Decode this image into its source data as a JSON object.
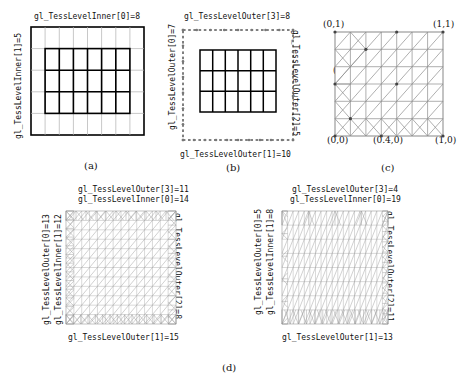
{
  "figure": {
    "caption_labels": [
      "(a)",
      "(b)",
      "(c)",
      "(d)"
    ]
  },
  "panel_a": {
    "name": "quad-inner-tessellation",
    "top_label": "gl_TessLevelInner[0]=8",
    "left_label": "gl_TessLevelInner[1]=5",
    "inner_u": 8,
    "inner_v": 5
  },
  "panel_b": {
    "name": "quad-outer-tessellation",
    "top_label": "gl_TessLevelOuter[3]=8",
    "left_label": "gl_TessLevelOuter[0]=7",
    "right_label": "gl_TessLevelOuter[2]=5",
    "bottom_label": "gl_TessLevelOuter[1]=10",
    "outer": [
      7,
      10,
      5,
      8
    ]
  },
  "panel_c": {
    "name": "quad-domain-coordinates",
    "corner_labels": [
      "(0,1)",
      "(1,1)",
      "(0,0)",
      "(1,0)"
    ],
    "interior_labels": [
      "(0.25,0.8)",
      "(0,0.57)",
      "(0.5,0.4)",
      "(0.4,0)"
    ],
    "points": [
      {
        "label": "(0,1)",
        "u": 0.0,
        "v": 1.0
      },
      {
        "label": "(1,1)",
        "u": 1.0,
        "v": 1.0
      },
      {
        "label": "(0,0)",
        "u": 0.0,
        "v": 0.0
      },
      {
        "label": "(1,0)",
        "u": 1.0,
        "v": 0.0
      },
      {
        "label": "(0.25,0.8)",
        "u": 0.25,
        "v": 0.8
      },
      {
        "label": "(0,0.57)",
        "u": 0.0,
        "v": 0.57
      },
      {
        "label": "(0.5,0.4)",
        "u": 0.5,
        "v": 0.4
      },
      {
        "label": "(0.4,0)",
        "u": 0.4,
        "v": 0.0
      }
    ]
  },
  "panel_d_left": {
    "name": "dense-tessellation-left",
    "top_label_1": "gl_TessLevelOuter[3]=11",
    "top_label_2": "gl_TessLevelInner[0]=14",
    "left_label_1": "gl_TessLevelOuter[0]=13",
    "left_label_2": "gl_TessLevelInner[1]=12",
    "right_label": "gl_TessLevelOuter[2]=8",
    "bottom_label": "gl_TessLevelOuter[1]=15",
    "inner": [
      14,
      12
    ],
    "outer": [
      13,
      15,
      8,
      11
    ]
  },
  "panel_d_right": {
    "name": "dense-tessellation-right",
    "top_label_1": "gl_TessLevelOuter[3]=4",
    "top_label_2": "gl_TessLevelInner[0]=19",
    "left_label_1": "gl_TessLevelOuter[0]=5",
    "left_label_2": "gl_TessLevelInner[1]=8",
    "right_label": "gl_TessLevelOuter[2]=11",
    "bottom_label": "gl_TessLevelOuter[1]=13",
    "inner": [
      19,
      8
    ],
    "outer": [
      5,
      13,
      11,
      4
    ]
  },
  "colors": {
    "line_dark": "#000000",
    "line_mid": "#555555",
    "line_light": "#9a9a9a",
    "text": "#111111"
  }
}
